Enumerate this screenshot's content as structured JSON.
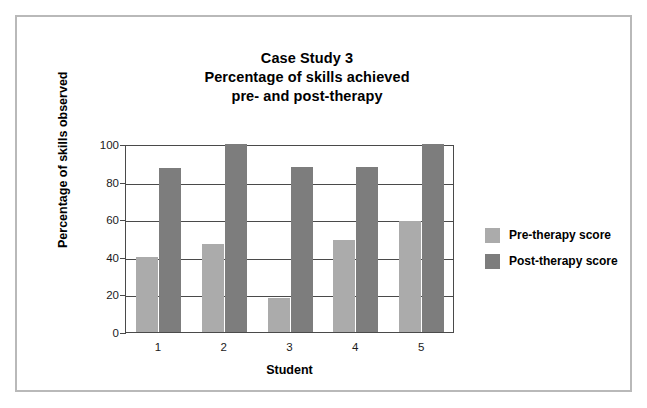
{
  "chart_data": {
    "type": "bar",
    "title": "Case Study 3\nPercentage of skills achieved\npre- and post-therapy",
    "title_lines": [
      "Case Study 3",
      "Percentage of skills achieved",
      "pre- and post-therapy"
    ],
    "xlabel": "Student",
    "ylabel": "Percentage of skills observed",
    "categories": [
      "1",
      "2",
      "3",
      "4",
      "5"
    ],
    "series": [
      {
        "name": "Pre-therapy score",
        "color": "#ababab",
        "values": [
          40,
          47,
          18,
          49,
          59
        ]
      },
      {
        "name": "Post-therapy score",
        "color": "#7d7d7d",
        "values": [
          87,
          100,
          88,
          88,
          100
        ]
      }
    ],
    "ylim": [
      0,
      100
    ],
    "yticks": [
      0,
      20,
      40,
      60,
      80,
      100
    ],
    "ytick_labels": [
      "0",
      "20",
      "40",
      "60",
      "80",
      "100"
    ],
    "grid": true,
    "grid_axis": "y",
    "legend_position": "right",
    "axis_color": "#4a4a4a",
    "frame_color": "#b9b9b9",
    "background": "#ffffff"
  }
}
